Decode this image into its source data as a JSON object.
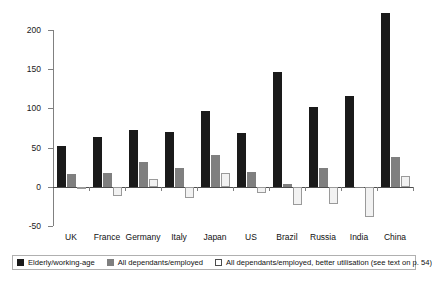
{
  "chart_data": {
    "type": "bar",
    "title": "",
    "subtitle": "",
    "xlabel": "",
    "ylabel": "",
    "ylim": [
      -50,
      200
    ],
    "yticks": [
      -50,
      0,
      50,
      100,
      150,
      200
    ],
    "ytick_labels": [
      "-50",
      "0",
      "50",
      "100",
      "150",
      "200"
    ],
    "grid": false,
    "legend_position": "bottom",
    "categories": [
      "UK",
      "France",
      "Germany",
      "Italy",
      "Japan",
      "US",
      "Brazil",
      "Russia",
      "India",
      "China"
    ],
    "series": [
      {
        "name": "Elderly/working-age",
        "color": "#1a1a1a",
        "values": [
          52,
          63,
          72,
          70,
          97,
          69,
          147,
          102,
          116,
          222
        ]
      },
      {
        "name": "All dependants/employed",
        "color": "#7f7f7f",
        "values": [
          16,
          17,
          32,
          24,
          40,
          19,
          3,
          24,
          -2,
          38
        ]
      },
      {
        "name": "All dependants/employed, better utilisation (see text on p. 54)",
        "color": "#f2f2f2",
        "values": [
          -3,
          -12,
          10,
          -14,
          17,
          -8,
          -23,
          -22,
          -38,
          14
        ]
      }
    ]
  },
  "legend": {
    "items": [
      {
        "label": "Elderly/working-age",
        "swatch": "black-square-icon"
      },
      {
        "label": "All dependants/employed",
        "swatch": "gray-square-icon"
      },
      {
        "label": "All dependants/employed, better utilisation (see text on p. 54)",
        "swatch": "white-square-icon"
      }
    ]
  }
}
